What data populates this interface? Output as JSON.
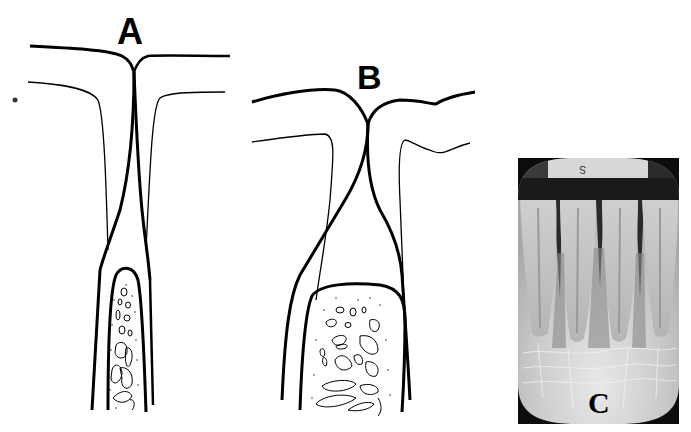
{
  "figure": {
    "panels": [
      {
        "id": "A",
        "label": "A",
        "type": "line-drawing",
        "description": "Interdental septum with narrow tapering crest between adjacent roots"
      },
      {
        "id": "B",
        "label": "B",
        "type": "line-drawing",
        "description": "Interdental septum with broad rounded crest between divergent roots"
      },
      {
        "id": "C",
        "label": "C",
        "type": "radiograph",
        "description": "Periapical radiograph of mandibular incisors",
        "film_mark": "S"
      }
    ]
  },
  "colors": {
    "background": "#ffffff",
    "ink": "#000000",
    "film_dark": "#0d0d0d",
    "film_light": "#d9d9d9"
  }
}
